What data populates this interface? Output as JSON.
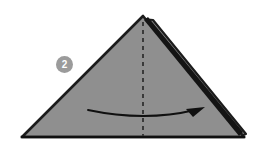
{
  "diagram": {
    "step_badge": {
      "label": "2",
      "fill_color": "#9b9b9b",
      "text_color": "#ffffff"
    },
    "colors": {
      "background": "#ffffff",
      "paper_fill": "#8f8f8f",
      "paper_outline": "#1c1c1c",
      "flap_shadow": "#141414",
      "fold_line": "#3a3a3a",
      "arrow": "#101010"
    },
    "shapes": {
      "main_triangle": {
        "name": "folded-paper-triangle",
        "points": "143,16 244,137 22,137",
        "fill": "#8f8f8f",
        "stroke": "#1c1c1c",
        "stroke_width": 2.6
      },
      "back_flap": {
        "name": "back-flap-layer",
        "points": "153,20 246,134 238,137 143,19",
        "fill": "#8f8f8f",
        "stroke": "#1c1c1c",
        "stroke_width": 2.2
      },
      "flap_edge_highlight": {
        "name": "flap-edge-stripe",
        "points": "149,18 243,133 240,136 146,21",
        "fill": "#141414"
      },
      "baseline": {
        "name": "bottom-edge",
        "x1": 22,
        "y1": 137,
        "x2": 244,
        "y2": 137,
        "stroke": "#101010",
        "stroke_width": 2.6
      },
      "fold_line": {
        "name": "center-fold-dashed-line",
        "x1": 143,
        "y1": 22,
        "x2": 143,
        "y2": 136,
        "stroke": "#3a3a3a",
        "stroke_width": 2,
        "dash_pattern": "4 4"
      },
      "fold_arrow": {
        "name": "fold-direction-arrow",
        "path": "M 88 110 Q 145 122 196 110",
        "stroke": "#101010",
        "stroke_width": 1.9,
        "arrowhead_points": "204,108 188,109 193,117"
      }
    }
  }
}
